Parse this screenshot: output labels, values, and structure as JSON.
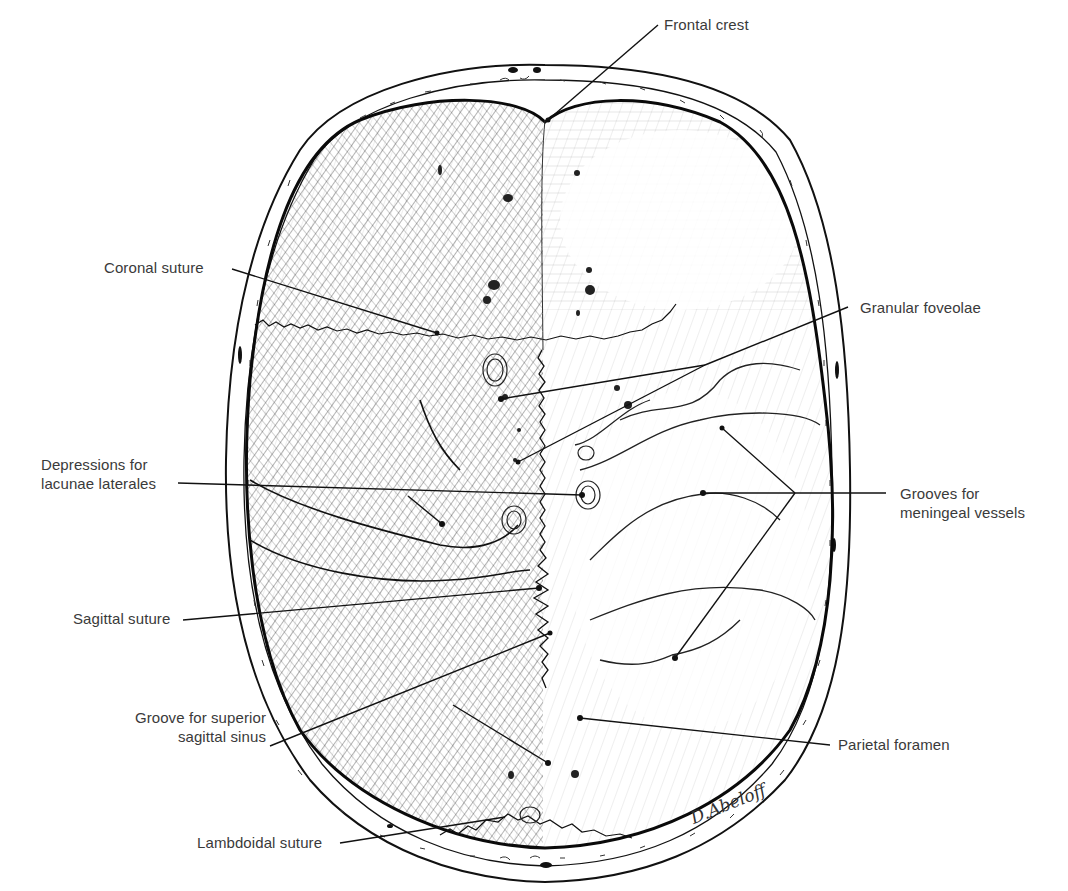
{
  "figure": {
    "signature": "D.Abeloff"
  },
  "labels": {
    "frontal_crest": "Frontal crest",
    "coronal_suture": "Coronal suture",
    "granular_foveolae": "Granular foveolae",
    "depressions_line1": "Depressions for",
    "depressions_line2": "lacunae laterales",
    "grooves_line1": "Grooves for",
    "grooves_line2": "meningeal vessels",
    "sagittal_suture": "Sagittal suture",
    "groove_line1": "Groove for superior",
    "groove_line2": "sagittal sinus",
    "parietal_foramen": "Parietal foramen",
    "lambdoidal_suture": "Lambdoidal suture"
  },
  "colors": {
    "ink": "#1a1a1a",
    "label_text": "#3a3a3a",
    "background": "#ffffff"
  }
}
